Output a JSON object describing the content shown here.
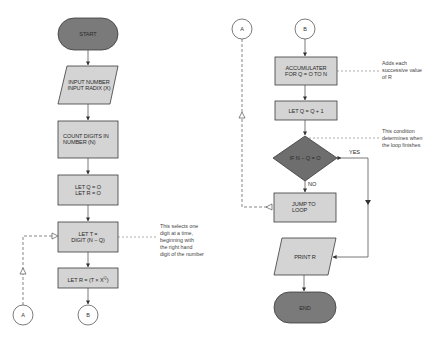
{
  "colors": {
    "terminal_fill": "#7a7a7a",
    "process_fill": "#d4d4d4",
    "decision_fill": "#6e6e6e",
    "stroke": "#3a3a3a",
    "line": "#555555"
  },
  "left_flow": {
    "start": "START",
    "input": "INPUT NUMBER\nINPUT RADIX (X)",
    "count": "COUNT DIGITS IN\nNUMBER (N)",
    "init": "LET Q = O\nLET R = O",
    "let_t": "LET T =\nDIGIT (N − Q)",
    "let_r_prefix": "LET R = (T × X",
    "let_r_sup": "Q",
    "let_r_suffix": ")",
    "connector_a": "A",
    "connector_b": "B",
    "note": "This selects one\ndigit at a time,\nbeginning with\nthe right hand\ndigit of the number"
  },
  "right_flow": {
    "connector_a": "A",
    "connector_b": "B",
    "accumulator": "ACCUMULATER\nFOR Q = O TO N",
    "increment": "LET Q = Q + 1",
    "decision": "IF N − Q = O",
    "yes_label": "YES",
    "no_label": "NO",
    "jump": "JUMP TO\nLOOP",
    "print": "PRINT R",
    "end": "END",
    "note_accumulator": "Adds each\nsuccessive value\nof R",
    "note_condition": "This condition\ndetermines when\nthe loop finishes"
  }
}
